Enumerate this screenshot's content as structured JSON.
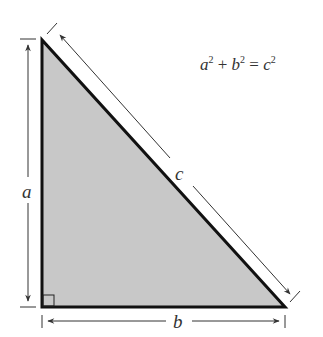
{
  "diagram": {
    "equation": {
      "a": "a",
      "b": "b",
      "c": "c",
      "exp": "2",
      "plus": "+",
      "equals": "="
    },
    "labels": {
      "leg_vertical": "a",
      "leg_horizontal": "b",
      "hypotenuse": "c"
    },
    "colors": {
      "fill": "#c8c8c8",
      "stroke": "#111111",
      "arrow": "#333333"
    }
  }
}
